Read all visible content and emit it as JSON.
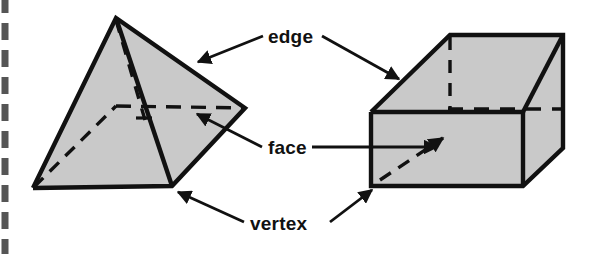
{
  "page": {
    "background_color": "#ffffff",
    "width": 598,
    "height": 254
  },
  "style": {
    "fill_gray": "#c9c9c9",
    "stroke_black": "#111111",
    "dash_border_gray": "#555555",
    "stroke_width_outline": 4,
    "stroke_width_hidden": 3,
    "stroke_width_leader": 2.6
  },
  "labels": [
    {
      "id": "edge",
      "text": "edge",
      "x": 268,
      "y": 27
    },
    {
      "id": "face",
      "text": "face",
      "x": 268,
      "y": 138
    },
    {
      "id": "vertex",
      "text": "vertex",
      "x": 250,
      "y": 214
    }
  ],
  "shapes": {
    "pyramid": {
      "name": "square-pyramid",
      "apex": [
        116,
        18
      ],
      "base_front_left": [
        33,
        188
      ],
      "base_front_right": [
        172,
        186
      ],
      "base_right": [
        245,
        108
      ],
      "base_back_hidden": [
        116,
        105
      ],
      "altitude_foot": [
        145,
        120
      ],
      "visible_faces": [
        {
          "name": "left-face",
          "points": "116,18 33,188 172,186"
        },
        {
          "name": "right-face",
          "points": "116,18 172,186 245,108"
        }
      ],
      "hidden_edges": [
        {
          "name": "base-back-left-hidden",
          "from": [
            33,
            188
          ],
          "to": [
            116,
            105
          ]
        },
        {
          "name": "base-back-right-hidden",
          "from": [
            116,
            105
          ],
          "to": [
            245,
            108
          ]
        },
        {
          "name": "altitude-hidden",
          "from": [
            116,
            18
          ],
          "to": [
            145,
            120
          ]
        }
      ]
    },
    "prism": {
      "name": "rectangular-prism",
      "front_top_left": [
        371,
        112
      ],
      "front_top_right": [
        563,
        112
      ],
      "front_bottom_left": [
        371,
        186
      ],
      "front_bottom_right": [
        563,
        186
      ],
      "back_top_left": [
        450,
        35
      ],
      "back_top_right": [
        563,
        35
      ],
      "back_bottom_right_hidden": [
        563,
        108
      ],
      "back_bottom_left_hidden": [
        450,
        108
      ],
      "visible_faces": [
        {
          "name": "front-face",
          "points": "371,112 523,112 523,186 371,186"
        },
        {
          "name": "top-face",
          "points": "371,112 450,35 563,35 523,112"
        },
        {
          "name": "right-face",
          "points": "523,112 563,35 563,148 523,186"
        }
      ],
      "hidden_edges": [
        {
          "name": "back-vertical-hidden",
          "from": [
            450,
            35
          ],
          "to": [
            450,
            108
          ]
        },
        {
          "name": "back-bottom-hidden",
          "from": [
            450,
            108
          ],
          "to": [
            563,
            108
          ]
        },
        {
          "name": "interior-diagonal-arrow",
          "from": [
            382,
            175
          ],
          "to": [
            440,
            140
          ]
        }
      ]
    }
  },
  "leaders": [
    {
      "name": "edge-leader-left",
      "from": [
        263,
        36
      ],
      "to": [
        197,
        62
      ],
      "arrow": true
    },
    {
      "name": "edge-leader-right",
      "from": [
        320,
        36
      ],
      "to": [
        400,
        79
      ],
      "arrow": true
    },
    {
      "name": "face-leader-left",
      "from": [
        263,
        147
      ],
      "to": [
        196,
        113
      ],
      "arrow": true
    },
    {
      "name": "face-leader-right",
      "from": [
        320,
        147
      ],
      "to": [
        430,
        147
      ],
      "arrow": true
    },
    {
      "name": "vertex-leader-left",
      "from": [
        245,
        222
      ],
      "to": [
        176,
        191
      ],
      "arrow": true
    },
    {
      "name": "vertex-leader-right",
      "from": [
        324,
        222
      ],
      "to": [
        371,
        189
      ],
      "arrow": true
    }
  ],
  "border": {
    "name": "left-dashed-border",
    "x": 5,
    "y_start": 0,
    "y_end": 254,
    "dash": "17 10",
    "width": 7
  }
}
